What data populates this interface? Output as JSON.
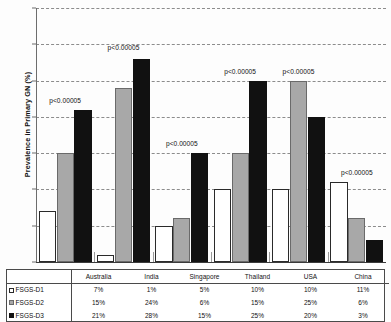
{
  "chart_data": {
    "type": "bar",
    "title": "",
    "xlabel": "",
    "ylabel": "Prevalence in Primary GN (%)",
    "ylim": [
      0,
      0.35
    ],
    "yticks": [
      "0",
      "0.05",
      "0.1",
      "0.15",
      "0.2",
      "0.25",
      "0.3",
      "0.35"
    ],
    "ytick_values": [
      0,
      0.05,
      0.1,
      0.15,
      0.2,
      0.25,
      0.3,
      0.35
    ],
    "grid": true,
    "legend_position": "table-below",
    "categories": [
      "Australia",
      "India",
      "Singapore",
      "Thailand",
      "USA",
      "China"
    ],
    "series": [
      {
        "name": "FSGS-D1",
        "color": "#ffffff",
        "values": [
          0.07,
          0.01,
          0.05,
          0.1,
          0.1,
          0.11
        ]
      },
      {
        "name": "FSGS-D2",
        "color": "#a8a8a8",
        "values": [
          0.15,
          0.24,
          0.06,
          0.15,
          0.25,
          0.06
        ]
      },
      {
        "name": "FSGS-D3",
        "color": "#111111",
        "values": [
          0.21,
          0.28,
          0.15,
          0.25,
          0.2,
          0.03
        ]
      }
    ],
    "annotations": [
      {
        "text": "p<0.00005",
        "category": "Australia",
        "y": 0.228
      },
      {
        "text": "p<0.00005",
        "category": "India",
        "y": 0.3
      },
      {
        "text": "p<0.00005",
        "category": "Singapore",
        "y": 0.168
      },
      {
        "text": "p<0.00005",
        "category": "Thailand",
        "y": 0.268
      },
      {
        "text": "p<0.00005",
        "category": "USA",
        "y": 0.268
      },
      {
        "text": "p<0.00005",
        "category": "China",
        "y": 0.128
      }
    ]
  },
  "table": {
    "header": [
      "",
      "Australia",
      "India",
      "Singapore",
      "Thailand",
      "USA",
      "China"
    ],
    "rows": [
      {
        "label": "FSGS-D1",
        "swatch": "sw1",
        "cells": [
          "7%",
          "1%",
          "5%",
          "10%",
          "10%",
          "11%"
        ]
      },
      {
        "label": "FSGS-D2",
        "swatch": "sw2",
        "cells": [
          "15%",
          "24%",
          "6%",
          "15%",
          "25%",
          "6%"
        ]
      },
      {
        "label": "FSGS-D3",
        "swatch": "sw3",
        "cells": [
          "21%",
          "28%",
          "15%",
          "25%",
          "20%",
          "3%"
        ]
      }
    ]
  }
}
